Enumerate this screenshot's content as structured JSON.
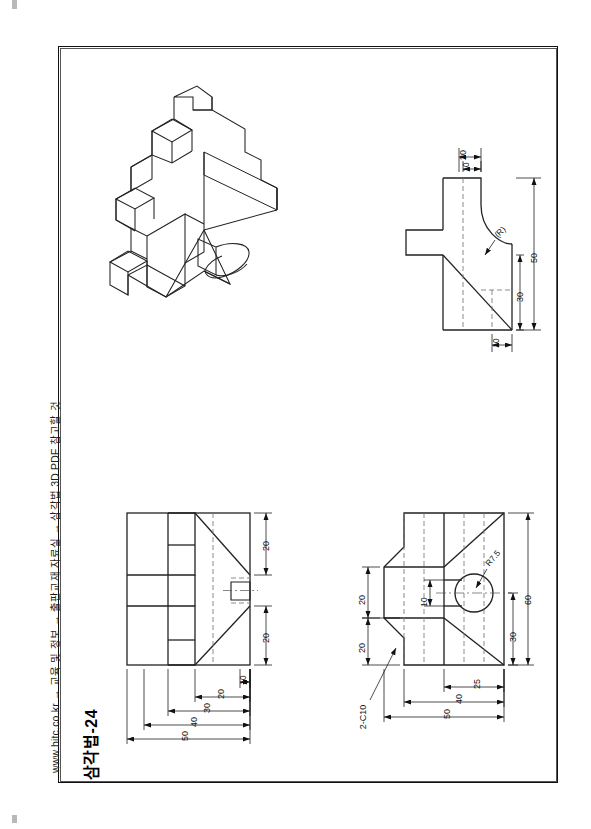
{
  "sheet": {
    "title": "삼각법-24",
    "reference_line": "www.hitc.co.kr → 교육 및 정보 → 출판교재 자료실 → 삼각법 3D PDF 참고할 것",
    "orientation": "landscape-drawing-rotated-90",
    "border_color": "#111111",
    "line_color": "#222222",
    "hidden_line_color": "#777777",
    "center_line_color": "#555555"
  },
  "views": {
    "isometric": {
      "name": "isometric-pictorial-view",
      "label": ""
    },
    "right_view": {
      "name": "right-side-view",
      "dimensions": [
        "20",
        "10",
        "50",
        "30",
        "10",
        "(R)"
      ]
    },
    "top_view": {
      "name": "top-view",
      "dimensions": [
        "20",
        "20",
        "10",
        "20",
        "30",
        "40",
        "50"
      ]
    },
    "front_view": {
      "name": "front-view",
      "dimensions": [
        "20",
        "20",
        "10",
        "R7.5",
        "60",
        "30",
        "25",
        "40",
        "50",
        "2-C10"
      ]
    }
  },
  "dimensions": {
    "right_view": {
      "d_20": "20",
      "d_10_top": "10",
      "d_50": "50",
      "d_30": "30",
      "d_10_bottom": "10",
      "d_R": "(R)"
    },
    "top_view": {
      "d_20_upper": "20",
      "d_20_lower": "20",
      "d_10": "10",
      "d_20": "20",
      "d_30": "30",
      "d_40": "40",
      "d_50": "50"
    },
    "front_view": {
      "d_20_upper": "20",
      "d_20_lower": "20",
      "d_10": "10",
      "d_R75": "R7.5",
      "d_60": "60",
      "d_30": "30",
      "d_25": "25",
      "d_40": "40",
      "d_50": "50",
      "d_chamfer": "2-C10"
    }
  }
}
